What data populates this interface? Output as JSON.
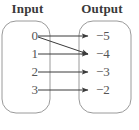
{
  "diagram": {
    "type": "mapping-diagram",
    "title_input": "Input",
    "title_output": "Output",
    "colors": {
      "set_outline": "#9a9a9a",
      "arrow": "#3b3b3b",
      "label_text": "#555555",
      "header_text": "#3a3a3a",
      "background": "#ffffff"
    },
    "input_set": {
      "name": "Input",
      "elements": [
        {
          "label": "0",
          "x": 34,
          "y": 36
        },
        {
          "label": "1",
          "x": 34,
          "y": 54
        },
        {
          "label": "2",
          "x": 34,
          "y": 72
        },
        {
          "label": "3",
          "x": 34,
          "y": 90
        }
      ],
      "box": {
        "x": 2,
        "y": 21,
        "width": 48,
        "height": 92,
        "radius": 14
      }
    },
    "output_set": {
      "name": "Output",
      "elements": [
        {
          "label": "−5",
          "x": 93,
          "y": 36
        },
        {
          "label": "−4",
          "x": 93,
          "y": 54
        },
        {
          "label": "−3",
          "x": 93,
          "y": 72
        },
        {
          "label": "−2",
          "x": 93,
          "y": 90
        }
      ],
      "box": {
        "x": 79,
        "y": 21,
        "width": 52,
        "height": 92,
        "radius": 14
      }
    },
    "arrows": [
      {
        "from": "0",
        "to": "−5",
        "x1": 38,
        "y1": 36,
        "x2": 88,
        "y2": 36
      },
      {
        "from": "0",
        "to": "−4",
        "x1": 38,
        "y1": 37,
        "x2": 88,
        "y2": 54
      },
      {
        "from": "1",
        "to": "−4",
        "x1": 38,
        "y1": 54,
        "x2": 88,
        "y2": 54
      },
      {
        "from": "2",
        "to": "−3",
        "x1": 38,
        "y1": 72,
        "x2": 88,
        "y2": 72
      },
      {
        "from": "3",
        "to": "−2",
        "x1": 38,
        "y1": 90,
        "x2": 88,
        "y2": 90
      }
    ]
  }
}
